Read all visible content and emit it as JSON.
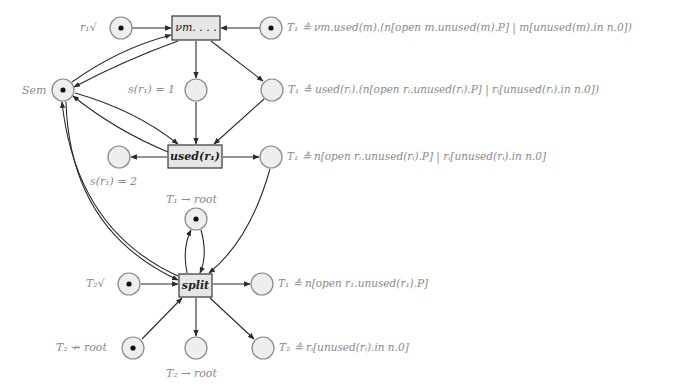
{
  "diagram": {
    "type": "petri-net",
    "colors": {
      "line": "#2a2a2a",
      "place_fill": "#eeeeee",
      "place_stroke": "#8a8a8a",
      "transition_fill": "#e6e6e6",
      "transition_stroke": "#444444",
      "token": "#111111",
      "label_light": "#8a8a8a",
      "label_dark": "#333333"
    },
    "transitions": [
      {
        "id": "t_vm",
        "label": "νm. . . ."
      },
      {
        "id": "t_used",
        "label": "used(r₁)"
      },
      {
        "id": "t_split",
        "label": "split"
      }
    ],
    "places": [
      {
        "id": "p_r1ok",
        "label": "r₁√",
        "token": true
      },
      {
        "id": "p_T1_top",
        "label": "T₁ ≙ νm.used(m).(n[open m.unused(m).P] | m[unused(m).in n.0])",
        "token": true
      },
      {
        "id": "p_sem",
        "label": "Sem",
        "token": true
      },
      {
        "id": "p_s1",
        "label": "s(r₁) = 1",
        "token": false
      },
      {
        "id": "p_T1_used",
        "label": "T₁ ≙ used(rᵢ).(n[open rᵢ.unused(rᵢ).P] | rᵢ[unused(rᵢ).in n.0])",
        "token": false
      },
      {
        "id": "p_s2",
        "label": "s(r₁) = 2",
        "token": false
      },
      {
        "id": "p_T1_after",
        "label": "T₁ ≙ n[open rᵢ.unused(rᵢ).P] | rᵢ[unused(rᵢ).in n.0]",
        "token": false
      },
      {
        "id": "p_T1_root",
        "label": "T₁ → root",
        "token": true
      },
      {
        "id": "p_T2ok",
        "label": "T₂√",
        "token": true
      },
      {
        "id": "p_T1_split",
        "label": "T₁ ≙ n[open r₁.unused(r₁).P]",
        "token": false
      },
      {
        "id": "p_T2_notroot",
        "label": "T₂ ↛ root",
        "token": true
      },
      {
        "id": "p_T2_root",
        "label": "T₂ → root",
        "token": false
      },
      {
        "id": "p_T2_split",
        "label": "T₂ ≙ rᵢ[unused(rᵢ).in n.0]",
        "token": false
      }
    ]
  }
}
